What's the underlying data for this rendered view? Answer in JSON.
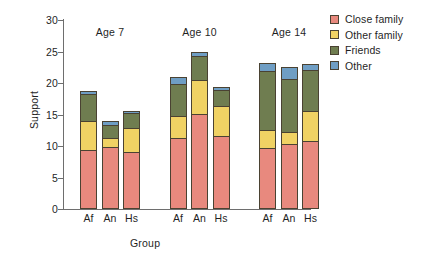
{
  "chart_data": {
    "type": "bar",
    "stacked": true,
    "title": "",
    "xlabel": "Group",
    "ylabel": "Support",
    "ylim": [
      0,
      30
    ],
    "yticks": [
      0,
      5,
      10,
      15,
      20,
      25,
      30
    ],
    "grid": false,
    "legend_position": "right",
    "categories": [
      "Af",
      "An",
      "Hs",
      "Af",
      "An",
      "Hs",
      "Af",
      "An",
      "Hs"
    ],
    "groups": [
      {
        "label": "Age 7",
        "categories": [
          "Af",
          "An",
          "Hs"
        ]
      },
      {
        "label": "Age 10",
        "categories": [
          "Af",
          "An",
          "Hs"
        ]
      },
      {
        "label": "Age 14",
        "categories": [
          "Af",
          "An",
          "Hs"
        ]
      }
    ],
    "series": [
      {
        "name": "Close family",
        "color": "#e8897e",
        "values": [
          9.4,
          9.9,
          9.1,
          11.3,
          15.1,
          11.6,
          9.7,
          10.3,
          10.8
        ]
      },
      {
        "name": "Other family",
        "color": "#f0d264",
        "values": [
          4.6,
          1.3,
          3.7,
          3.5,
          5.4,
          4.7,
          2.9,
          1.9,
          4.7
        ]
      },
      {
        "name": "Friends",
        "color": "#6f7d50",
        "values": [
          4.2,
          2.1,
          2.4,
          5.0,
          3.8,
          2.6,
          9.3,
          8.4,
          6.5
        ]
      },
      {
        "name": "Other",
        "color": "#6f9ec4",
        "values": [
          0.6,
          0.6,
          0.4,
          1.2,
          0.6,
          0.5,
          1.3,
          1.9,
          1.1
        ]
      }
    ],
    "totals": [
      18.8,
      13.9,
      15.6,
      21.0,
      24.9,
      19.4,
      23.2,
      22.5,
      23.1
    ]
  },
  "legend": {
    "items": [
      {
        "label": "Close family",
        "color": "#e8897e"
      },
      {
        "label": "Other family",
        "color": "#f0d264"
      },
      {
        "label": "Friends",
        "color": "#6f7d50"
      },
      {
        "label": "Other",
        "color": "#6f9ec4"
      }
    ]
  }
}
